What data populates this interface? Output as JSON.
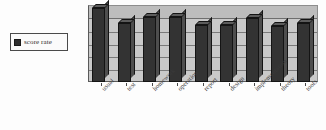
{
  "legend": {
    "swatch_color": "#2e2e2e",
    "entries": [
      {
        "label": "score rate",
        "color": "#2e2e2e"
      }
    ]
  },
  "axis": {
    "baseline_color": "#5a5a5a",
    "plot_background": "#c9c9c9",
    "gridlines_visible": true
  },
  "chart_data": {
    "type": "bar",
    "title": "",
    "subtitle": "",
    "xlabel": "",
    "ylabel": "",
    "ylim": [
      0,
      100
    ],
    "grid": true,
    "legend_position": "left-outside",
    "style": "3d-column",
    "categories": [
      "usual",
      "test",
      "homework",
      "operation",
      "report",
      "design",
      "implementation",
      "theory",
      "tools"
    ],
    "series": [
      {
        "name": "score rate",
        "color": "#333333",
        "values": [
          97,
          78,
          85,
          86,
          75,
          75,
          84,
          74,
          77
        ]
      }
    ]
  }
}
